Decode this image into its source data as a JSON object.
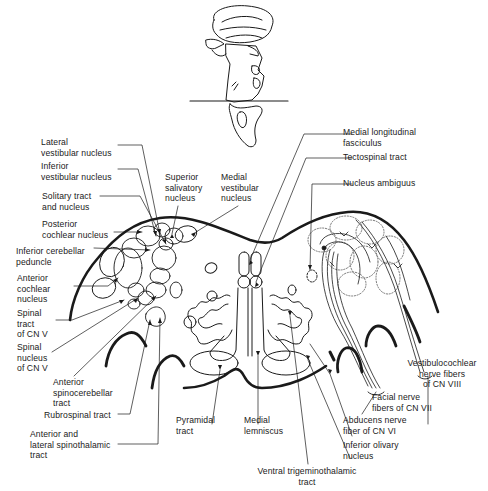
{
  "figure": {
    "line_color": "#1a1a1a",
    "background": "#ffffff"
  },
  "labels_left": [
    {
      "id": "lateral-vestibular-nucleus",
      "text": "Lateral\nvestibular nucleus"
    },
    {
      "id": "inferior-vestibular-nucleus",
      "text": "Inferior\nvestibular nucleus"
    },
    {
      "id": "solitary-tract-and-nucleus",
      "text": "Solitary tract\nand nucleus"
    },
    {
      "id": "posterior-cochlear-nucleus",
      "text": "Posterior\ncochlear nucleus"
    },
    {
      "id": "inferior-cerebellar-peduncle",
      "text": "Inferior cerebellar\npeduncle"
    },
    {
      "id": "anterior-cochlear-nucleus",
      "text": "Anterior\ncochlear\nnucleus"
    },
    {
      "id": "spinal-tract-cn-v",
      "text": "Spinal\ntract\nof CN V"
    },
    {
      "id": "spinal-nucleus-cn-v",
      "text": "Spinal\nnucleus\nof CN V"
    },
    {
      "id": "anterior-spinocerebellar-tract",
      "text": "Anterior\nspinocerebellar\ntract"
    },
    {
      "id": "rubrospinal-tract",
      "text": "Rubrospinal tract"
    },
    {
      "id": "anterior-lateral-spinothalamic-tract",
      "text": "Anterior and\nlateral spinothalamic\ntract"
    }
  ],
  "labels_top": [
    {
      "id": "superior-salivatory-nucleus",
      "text": "Superior\nsalivatory\nnucleus"
    },
    {
      "id": "medial-vestibular-nucleus",
      "text": "Medial\nvestibular\nnucleus"
    }
  ],
  "labels_right": [
    {
      "id": "medial-longitudinal-fasciculus",
      "text": "Medial longitudinal\nfasciculus"
    },
    {
      "id": "tectospinal-tract",
      "text": "Tectospinal tract"
    },
    {
      "id": "nucleus-ambiguus",
      "text": "Nucleus ambiguus"
    },
    {
      "id": "vestibulocochlear-nerve-fibers",
      "text": "Vestibulocochlear\nnerve fibers\nof CN VIII"
    },
    {
      "id": "facial-nerve-fibers",
      "text": "Facial nerve\nfibers of CN VII"
    },
    {
      "id": "abducens-nerve-fiber",
      "text": "Abducens nerve\nfiber of CN VI"
    },
    {
      "id": "inferior-olivary-nucleus",
      "text": "Inferior olivary\nnucleus"
    }
  ],
  "labels_bottom": [
    {
      "id": "pyramidal-tract",
      "text": "Pyramidal\ntract"
    },
    {
      "id": "medial-lemniscus",
      "text": "Medial\nlemniscus"
    },
    {
      "id": "ventral-trigeminothalamic-tract",
      "text": "Ventral trigeminothalamic\ntract"
    }
  ],
  "inset": {
    "description": "Brainstem and cerebellum lateral view with horizontal section plane line"
  }
}
